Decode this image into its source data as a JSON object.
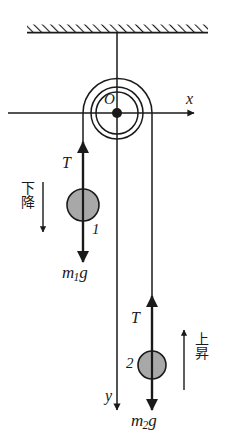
{
  "figure": {
    "colors": {
      "line": "#1a1a1a",
      "mass_fill": "#a8a8a8",
      "mass_stroke": "#1a1a1a",
      "hatch": "#1a1a1a",
      "background": "#ffffff"
    }
  },
  "ceiling": {
    "name": "hatched ceiling support",
    "x_left": 27,
    "x_right": 208,
    "y": 32,
    "thickness": 8
  },
  "pulley": {
    "center_label": "O",
    "center_x": 117,
    "center_y": 113,
    "outer_radius": 26,
    "inner_radius": 21,
    "hub_radius": 5
  },
  "axes": {
    "x_label": "x",
    "y_label": "y",
    "x_axis_y": 113,
    "x_axis_start": 8,
    "x_axis_end": 196,
    "y_axis_x": 117,
    "y_axis_end": 412
  },
  "left_side": {
    "mass_number": "1",
    "tension_label": "T",
    "weight_label_main": "m",
    "weight_label_sub": "1",
    "weight_label_tail": "g",
    "motion_label": "下降",
    "motion_direction": "down",
    "string_x": 83,
    "mass_center_y": 205,
    "mass_radius": 16
  },
  "right_side": {
    "mass_number": "2",
    "tension_label": "T",
    "weight_label_main": "m",
    "weight_label_sub": "2",
    "weight_label_tail": "g",
    "motion_label": "上昇",
    "motion_direction": "up",
    "string_x": 152,
    "mass_center_y": 365,
    "mass_radius": 14
  }
}
